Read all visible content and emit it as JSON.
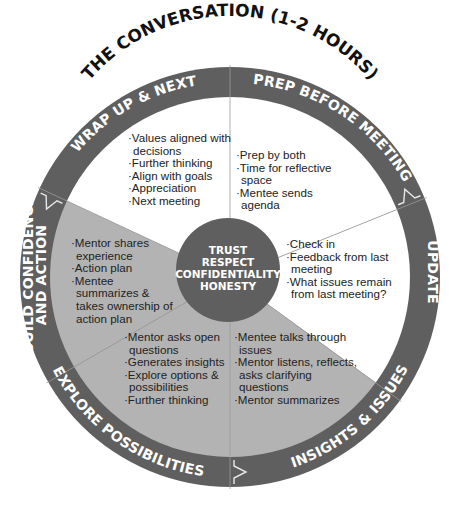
{
  "title": "THE CONVERSATION (1-2 HOURS)",
  "colors": {
    "ring": "#5f5f5f",
    "light_segment": "#ffffff",
    "shaded_segment": "#b3b3b3",
    "center": "#5f5f5f",
    "ring_text": "#ffffff",
    "body_text": "#222222",
    "title_text": "#111111"
  },
  "center": {
    "lines": [
      "TRUST",
      "RESPECT",
      "CONFIDENTIALITY",
      "HONESTY"
    ]
  },
  "stages": [
    {
      "id": "prep",
      "label": "PREP BEFORE MEETING",
      "shade": "light",
      "bullets": [
        "Prep by both",
        "Time for reflective space",
        "Mentee sends agenda"
      ]
    },
    {
      "id": "update",
      "label": "UPDATE",
      "shade": "light",
      "bullets": [
        "Check in",
        "Feedback from last meeting",
        "What issues remain from last meeting?"
      ]
    },
    {
      "id": "insights",
      "label": "INSIGHTS & ISSUES",
      "shade": "shaded",
      "bullets": [
        "Mentee talks through issues",
        "Mentor listens, reflects, asks clarifying questions",
        "Mentor summarizes"
      ]
    },
    {
      "id": "explore",
      "label": "EXPLORE POSSIBILITIES",
      "shade": "shaded",
      "bullets": [
        "Mentor asks open questions",
        "Generates insights",
        "Explore options & possibilities",
        "Further thinking"
      ]
    },
    {
      "id": "build",
      "label_lines": [
        "BUILD CONFIDENCE",
        "AND ACTION"
      ],
      "shade": "shaded",
      "bullets": [
        "Mentor shares experience",
        "Action plan",
        "Mentee summarizes & takes ownership of action plan"
      ]
    },
    {
      "id": "wrap",
      "label": "WRAP UP & NEXT",
      "shade": "light",
      "bullets": [
        "Values aligned with decisions",
        "Further thinking",
        "Align with goals",
        "Appreciation",
        "Next meeting"
      ]
    }
  ]
}
